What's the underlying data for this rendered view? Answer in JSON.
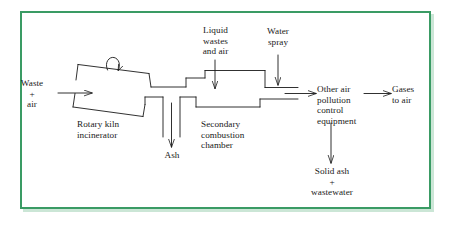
{
  "figure": {
    "type": "process-flow-diagram",
    "border_color": "#3a9b64",
    "line_color": "#1a1a1a",
    "background": "#ffffff",
    "width": 451,
    "height": 229
  },
  "labels": {
    "waste_air": "Waste\n+\nair",
    "rotary_kiln": "Rotary kiln\nincinerator",
    "liquid_wastes": "Liquid\nwastes\nand air",
    "water_spray": "Water\nspray",
    "ash": "Ash",
    "secondary_chamber": "Secondary\ncombustion\nchamber",
    "apc_equipment": "Other air\npollution\ncontrol\nequipment",
    "gases_to_air": "Gases\nto air",
    "solid_ash": "Solid ash\n+\nwastewater"
  },
  "flow": {
    "nodes": [
      {
        "id": "rotary-kiln",
        "label": "Rotary kiln incinerator",
        "shape": "tilted-parallelogram"
      },
      {
        "id": "secondary-combustion-chamber",
        "label": "Secondary combustion chamber",
        "shape": "rectangular-duct"
      },
      {
        "id": "air-pollution-control",
        "label": "Other air pollution control equipment",
        "shape": "text-block"
      }
    ],
    "inputs": [
      {
        "id": "waste-air-input",
        "label": "Waste + air",
        "target": "rotary-kiln",
        "direction": "right"
      },
      {
        "id": "liquid-wastes-input",
        "label": "Liquid wastes and air",
        "target": "secondary-combustion-chamber",
        "direction": "down"
      },
      {
        "id": "water-spray-input",
        "label": "Water spray",
        "target": "secondary-combustion-chamber-outlet",
        "direction": "down"
      }
    ],
    "outputs": [
      {
        "id": "ash-output",
        "label": "Ash",
        "source": "rotary-kiln",
        "direction": "down"
      },
      {
        "id": "gases-output",
        "label": "Gases to air",
        "source": "air-pollution-control",
        "direction": "right"
      },
      {
        "id": "solid-ash-output",
        "label": "Solid ash + wastewater",
        "source": "air-pollution-control",
        "direction": "down"
      }
    ],
    "connections": [
      {
        "from": "rotary-kiln",
        "to": "secondary-combustion-chamber"
      },
      {
        "from": "secondary-combustion-chamber",
        "to": "air-pollution-control",
        "arrow": true
      },
      {
        "from": "air-pollution-control",
        "to": "gases-output",
        "arrow": true
      }
    ],
    "annotations": [
      {
        "id": "kiln-rotation",
        "type": "rotation-arrow",
        "on": "rotary-kiln"
      }
    ]
  }
}
